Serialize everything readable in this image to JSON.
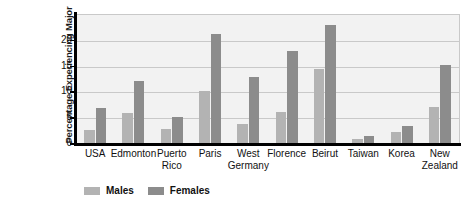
{
  "chart_data": {
    "type": "bar",
    "title": "",
    "subtitle": "",
    "xlabel": "",
    "ylabel": "Percentage Experiencing Major Depression during Lifetime",
    "ylim": [
      0,
      25
    ],
    "yticks": [
      0,
      5,
      10,
      15,
      20
    ],
    "ytick_labels": [
      "0",
      "5",
      "10",
      "15",
      "20"
    ],
    "grid": true,
    "legend_position": "bottom-left",
    "categories": [
      "USA",
      "Edmonton",
      "Puerto\nRico",
      "Paris",
      "West\nGermany",
      "Florence",
      "Beirut",
      "Taiwan",
      "Korea",
      "New\nZealand"
    ],
    "series": [
      {
        "name": "Males",
        "color": "#b3b3b3",
        "values": [
          2.8,
          6.0,
          2.9,
          10.2,
          3.9,
          6.2,
          14.5,
          1.0,
          2.4,
          7.2
        ]
      },
      {
        "name": "Females",
        "color": "#8c8c8c",
        "values": [
          7.0,
          12.2,
          5.3,
          21.4,
          13.0,
          18.0,
          23.0,
          1.6,
          3.4,
          15.4
        ]
      }
    ]
  },
  "axis": {
    "y_title": "Percentage Experiencing Major Depression during Lifetime"
  },
  "legend": {
    "entries": [
      {
        "label": "Males",
        "color": "#b3b3b3"
      },
      {
        "label": "Females",
        "color": "#8c8c8c"
      }
    ]
  },
  "colors": {
    "plot_background": "#f2f2f2",
    "gridline": "#c9c9c9",
    "axis": "#000000",
    "males_bar": "#b3b3b3",
    "females_bar": "#8c8c8c",
    "text": "#111111"
  }
}
